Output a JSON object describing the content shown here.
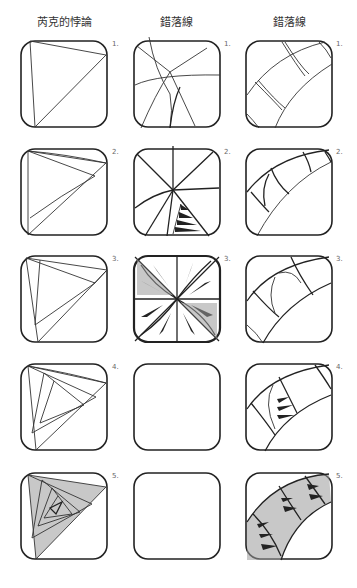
{
  "columns": [
    {
      "title": "芮克的悖論",
      "x": 9
    },
    {
      "title": "錯落線",
      "x": 121
    },
    {
      "title": "錯落線",
      "x": 234
    }
  ],
  "steps": {
    "s1": "1.",
    "s2": "2.",
    "s3": "3.",
    "s4": "4.",
    "s5": "5."
  },
  "colors": {
    "ink": "#222222",
    "background": "#ffffff",
    "step_label": "#666666"
  },
  "grid": {
    "columns_x": [
      20,
      133,
      245
    ],
    "rows_y": [
      40,
      148,
      255,
      363,
      472
    ],
    "tile_size": 88
  }
}
